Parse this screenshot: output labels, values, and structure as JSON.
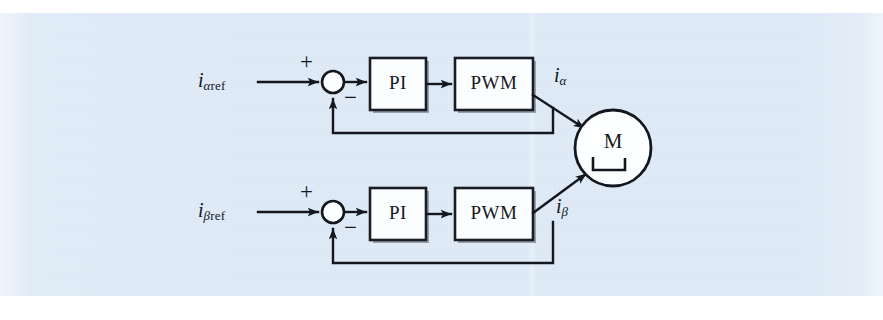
{
  "figure": {
    "kind": "control-block-diagram",
    "background_color": "#dce8f6",
    "line_color": "#14171d",
    "block_fill": "#fcfdff"
  },
  "blocks": [
    {
      "id": "pi-alpha",
      "label": "PI",
      "x": 370,
      "y": 58,
      "w": 56,
      "h": 52
    },
    {
      "id": "pwm-alpha",
      "label": "PWM",
      "x": 455,
      "y": 58,
      "w": 78,
      "h": 52
    },
    {
      "id": "pi-beta",
      "label": "PI",
      "x": 370,
      "y": 188,
      "w": 56,
      "h": 52
    },
    {
      "id": "pwm-beta",
      "label": "PWM",
      "x": 455,
      "y": 188,
      "w": 78,
      "h": 52
    }
  ],
  "motor": {
    "label": "M",
    "symbol": "dc-motor-bracket",
    "cx": 613,
    "cy": 148,
    "r": 38
  },
  "summing_junctions": [
    {
      "id": "sum-alpha",
      "cx": 333,
      "cy": 82,
      "r": 11,
      "plus": "+",
      "minus": "−"
    },
    {
      "id": "sum-beta",
      "cx": 333,
      "cy": 212,
      "r": 11,
      "plus": "+",
      "minus": "−"
    }
  ],
  "signals": {
    "alpha_ref": {
      "base": "i",
      "sub_greek": "α",
      "sub_roman": "ref"
    },
    "beta_ref": {
      "base": "i",
      "sub_greek": "β",
      "sub_roman": "ref"
    },
    "alpha_out": {
      "base": "i",
      "sub_greek": "α",
      "sub_roman": ""
    },
    "beta_out": {
      "base": "i",
      "sub_greek": "β",
      "sub_roman": ""
    }
  },
  "signs": {
    "alpha_plus": "+",
    "alpha_minus": "−",
    "beta_plus": "+",
    "beta_minus": "−"
  }
}
